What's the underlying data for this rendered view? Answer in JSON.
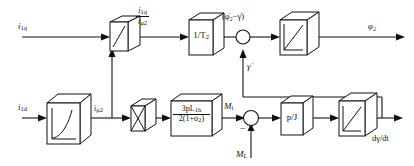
{
  "diagram": {
    "background": "#ffffff",
    "line_color": "#111111"
  },
  "labels": {
    "input_iq": "i",
    "input_iq_sub": "1q",
    "input_id": "i",
    "input_id_sub": "1d",
    "imu2_out": "i",
    "imu2_out_sub": "μ2",
    "ratio_num": "i",
    "ratio_num_sub": "1q",
    "ratio_den": "i",
    "ratio_den_sub": "μ2",
    "omega_diff": "(φ̇₂−γ̇)",
    "gamma_dot": "γ̇",
    "phi2_out": "φ₂",
    "torque_mi": "M",
    "torque_mi_sub": "i",
    "load_ml": "M",
    "load_ml_sub": "L",
    "minus_sign": "−",
    "dgamma_dt": "dγ/dt"
  },
  "blocks": [
    {
      "id": "divider-block",
      "name": "divider-block",
      "glyph": "division-slash",
      "text": ""
    },
    {
      "id": "gain-1-over-t2",
      "name": "gain-block-1-over-t2",
      "glyph": "text",
      "text": "1/T",
      "text_sub": "2"
    },
    {
      "id": "integrator-phi2",
      "name": "integrator-block-phi2",
      "glyph": "ramp-integrator",
      "text": ""
    },
    {
      "id": "magnetizing-curve",
      "name": "magnetizing-curve-block",
      "glyph": "saturation-curve",
      "text": ""
    },
    {
      "id": "multiplier-block",
      "name": "multiplier-block",
      "glyph": "cross-multiply",
      "text": ""
    },
    {
      "id": "torque-gain",
      "name": "torque-constant-block",
      "glyph": "fraction",
      "num": "3pL",
      "num_sub": "1h",
      "den": "2(1+σ",
      "den_sub": "2",
      "den_tail": ")"
    },
    {
      "id": "gain-p-over-j",
      "name": "gain-block-p-over-j",
      "glyph": "text",
      "text": "p/J",
      "text_sub": ""
    },
    {
      "id": "integrator-gamma",
      "name": "integrator-block-gamma",
      "glyph": "ramp-integrator",
      "text": ""
    }
  ],
  "junctions": [
    {
      "id": "sum-phi2",
      "name": "summing-junction-phi2",
      "signs": []
    },
    {
      "id": "sum-torque",
      "name": "summing-junction-torque",
      "signs": [
        "−"
      ]
    }
  ]
}
